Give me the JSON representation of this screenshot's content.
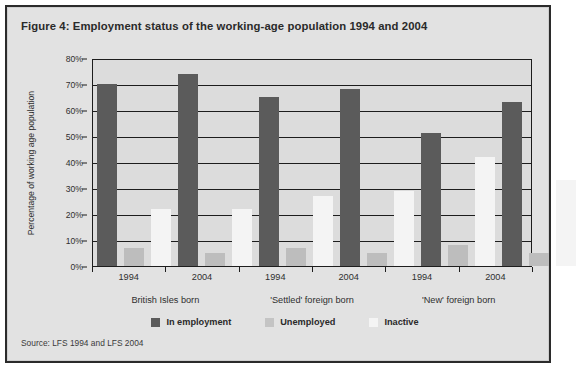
{
  "figure": {
    "title": "Figure 4: Employment status of the working-age population 1994 and 2004",
    "source": "Source: LFS 1994 and LFS 2004"
  },
  "colors": {
    "in_employment": "#5b5b5b",
    "unemployed": "#bdbdbd",
    "inactive": "#f4f4f4",
    "plot_background": "#dcdcdc",
    "panel_background": "#e2e2e2",
    "axis": "#1d1d1d"
  },
  "chart_data": {
    "type": "bar",
    "title": "Figure 4: Employment status of the working-age population 1994 and 2004",
    "xlabel": "",
    "ylabel": "Percentage of working age population",
    "ylim": [
      0,
      80
    ],
    "yticks": [
      "0%",
      "10%",
      "20%",
      "30%",
      "40%",
      "50%",
      "60%",
      "70%",
      "80%"
    ],
    "ytick_values": [
      0,
      10,
      20,
      30,
      40,
      50,
      60,
      70,
      80
    ],
    "grid": true,
    "legend_position": "bottom",
    "groups": [
      "British Isles born",
      "'Settled' foreign born",
      "'New' foreign born"
    ],
    "categories": [
      "1994",
      "2004",
      "1994",
      "2004",
      "1994",
      "2004"
    ],
    "series": [
      {
        "name": "In employment",
        "values": [
          70,
          74,
          65,
          68,
          51,
          63
        ]
      },
      {
        "name": "Unemployed",
        "values": [
          7,
          5,
          7,
          5,
          8,
          5
        ]
      },
      {
        "name": "Inactive",
        "values": [
          22,
          22,
          27,
          29,
          42,
          33
        ]
      }
    ]
  },
  "axis_title": "Percentage of working age population",
  "legend": [
    {
      "label": "In employment"
    },
    {
      "label": "Unemployed"
    },
    {
      "label": "Inactive"
    }
  ],
  "groups": [
    {
      "name": "British Isles born",
      "years": [
        {
          "year": "1994",
          "in_employment": 70,
          "unemployed": 7,
          "inactive": 22
        },
        {
          "year": "2004",
          "in_employment": 74,
          "unemployed": 5,
          "inactive": 22
        }
      ]
    },
    {
      "name": "'Settled' foreign born",
      "years": [
        {
          "year": "1994",
          "in_employment": 65,
          "unemployed": 7,
          "inactive": 27
        },
        {
          "year": "2004",
          "in_employment": 68,
          "unemployed": 5,
          "inactive": 29
        }
      ]
    },
    {
      "name": "'New' foreign born",
      "years": [
        {
          "year": "1994",
          "in_employment": 51,
          "unemployed": 8,
          "inactive": 42
        },
        {
          "year": "2004",
          "in_employment": 63,
          "unemployed": 5,
          "inactive": 33
        }
      ]
    }
  ]
}
